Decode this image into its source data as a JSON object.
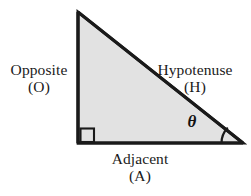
{
  "figure": {
    "background_color": "#ffffff",
    "stroke_color": "#1a1a1a",
    "fill_color": "#e2e2e2"
  },
  "labels": {
    "opposite": {
      "name": "Opposite",
      "abbrev": "(O)"
    },
    "hypotenuse": {
      "name": "Hypotenuse",
      "abbrev": "(H)"
    },
    "adjacent": {
      "name": "Adjacent",
      "abbrev": "(A)"
    },
    "theta": {
      "symbol": "θ"
    }
  },
  "geometry": {
    "vertices": {
      "apex": [
        78,
        12
      ],
      "bottom_left": [
        78,
        143
      ],
      "bottom_right": [
        243,
        143
      ]
    },
    "right_angle_marker": {
      "x": 79,
      "y": 128,
      "size": 14
    },
    "angle_arc_radius": 22
  }
}
